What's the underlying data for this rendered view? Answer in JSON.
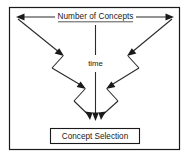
{
  "figure": {
    "name": "concept-selection-funnel-diagram",
    "background_color": "#ffffff",
    "line_color": "#2b2b2b",
    "border_color": "#1a1a1a",
    "width": 188,
    "height": 155
  },
  "labels": {
    "top_axis": "Number of Concepts",
    "vertical_axis": "time",
    "outcome_box": "Concept Selection"
  },
  "diagram_elements": {
    "top_arrow": {
      "name": "number-of-concepts-double-arrow",
      "direction": "bidirectional-horizontal",
      "from_x": 16,
      "to_x": 174,
      "y": 17
    },
    "time_arrow": {
      "name": "time-down-arrow",
      "direction": "down",
      "x": 95,
      "from_y": 25,
      "to_y": 120
    },
    "left_zigzag": {
      "name": "left-converging-zigzag",
      "arrowheads": 3
    },
    "right_zigzag": {
      "name": "right-converging-zigzag",
      "arrowheads": 3
    },
    "outcome_box": {
      "name": "concept-selection-box",
      "x": 50,
      "y": 128,
      "width": 90,
      "height": 15
    }
  }
}
